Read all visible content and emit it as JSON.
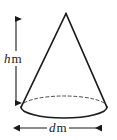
{
  "figure": {
    "kind": "geometry-diagram",
    "shape_name": "cone",
    "stroke_color": "#1a1a1a",
    "background_color": "#ffffff",
    "labels": {
      "height": {
        "variable": "h",
        "unit": "m",
        "full_text": "h m",
        "measures": "height",
        "orientation": "vertical"
      },
      "diameter": {
        "variable": "d",
        "unit": "m",
        "full_text": "d m",
        "measures": "diameter",
        "orientation": "horizontal"
      }
    },
    "geometry": {
      "apex": {
        "x": 66,
        "y": 13
      },
      "base_center": {
        "x": 64,
        "y": 107
      },
      "base_radius_x": 43,
      "base_radius_y": 11,
      "base_left": {
        "x": 21,
        "y": 107
      },
      "base_right": {
        "x": 107,
        "y": 107
      },
      "height_arrow": {
        "x": 16,
        "y_top": 13,
        "y_bottom": 109
      },
      "diameter_arrow": {
        "y": 128,
        "x_left": 13,
        "x_right": 107
      },
      "back_arc_style": "dashed",
      "front_arc_style": "solid"
    }
  }
}
